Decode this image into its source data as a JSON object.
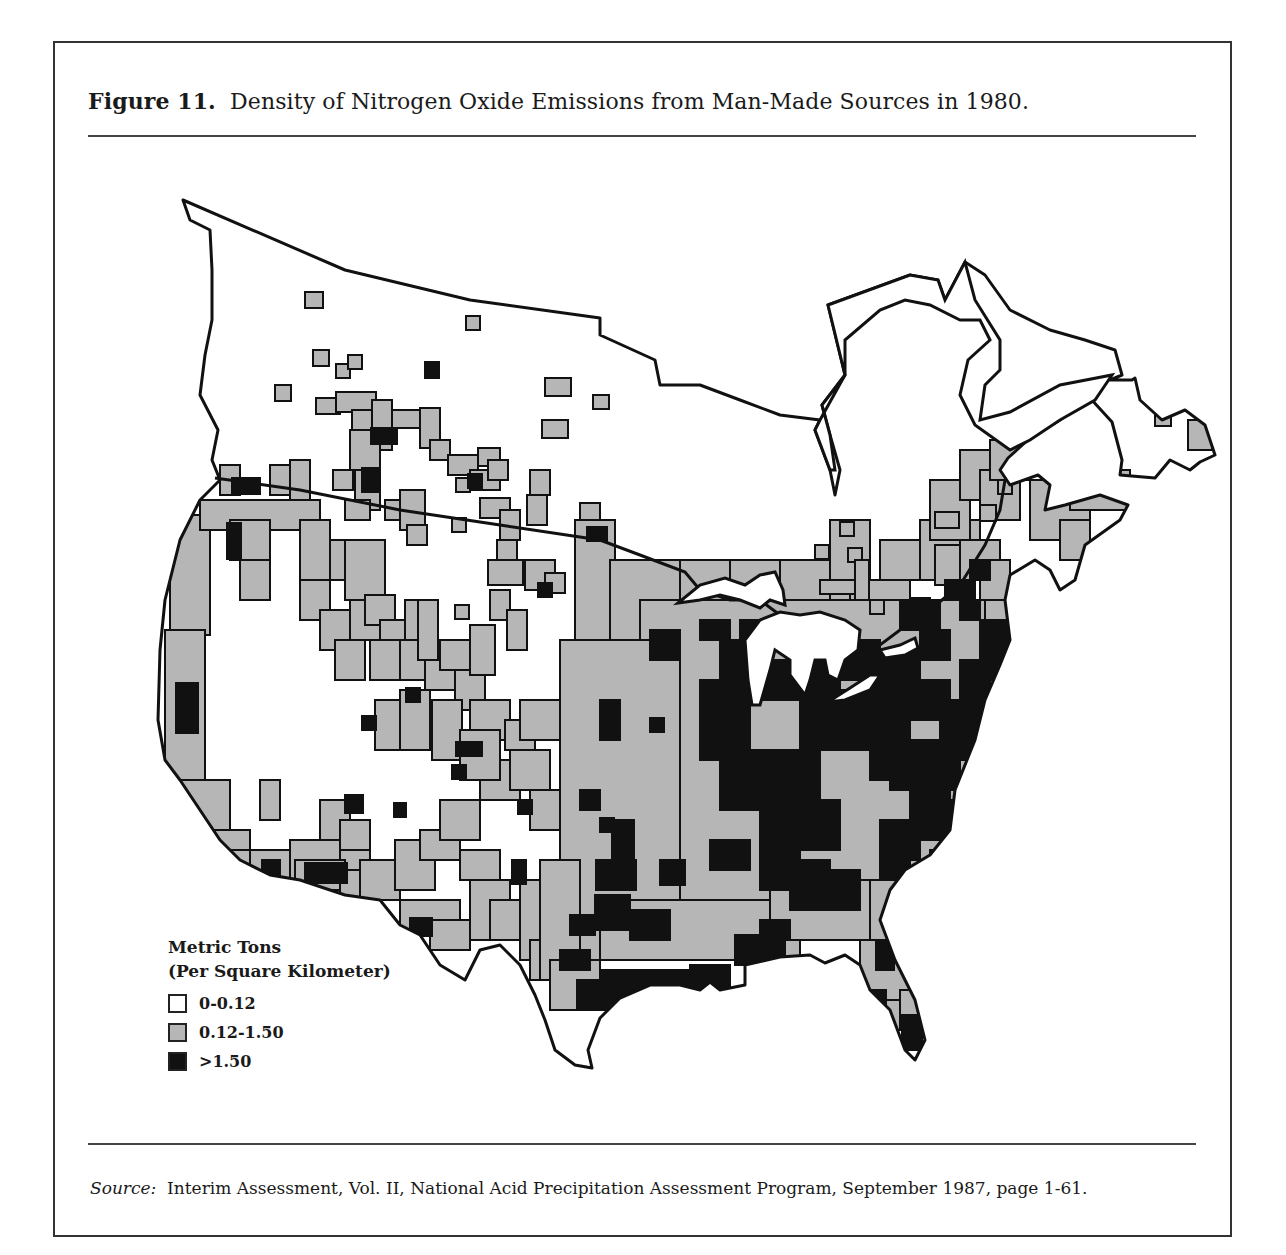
{
  "figure": {
    "label": "Figure 11.",
    "title": "Density of Nitrogen Oxide Emissions from Man-Made Sources in 1980."
  },
  "legend": {
    "title_line1": "Metric Tons",
    "title_line2": "(Per Square Kilometer)",
    "items": [
      {
        "label": "0-0.12",
        "color": "#ffffff"
      },
      {
        "label": "0.12-1.50",
        "color": "#b6b6b6"
      },
      {
        "label": ">1.50",
        "color": "#111111"
      }
    ]
  },
  "source": {
    "prefix": "Source:",
    "text": "Interim Assessment, Vol. II, National Acid Precipitation Assessment Program, September 1987, page 1-61."
  },
  "chart_data": {
    "type": "heatmap",
    "title": "Density of Nitrogen Oxide Emissions from Man-Made Sources in 1980",
    "subtitle": "Figure 11",
    "region": "Canada and contiguous United States",
    "units": "Metric Tons (Per Square Kilometer)",
    "categories": [
      "0-0.12",
      "0.12-1.50",
      ">1.50"
    ],
    "colors": {
      "low": "#ffffff",
      "mid": "#b6b6b6",
      "high": "#111111"
    },
    "legend_position": "lower-left",
    "summary": {
      "high_density_regions": [
        "Ohio Valley / Great Lakes",
        "Northeast corridor",
        "Gulf Coast (Texas, Louisiana)",
        "Southern California",
        "Pacific Northwest (Puget Sound)",
        "Florida"
      ],
      "mid_density_regions": [
        "Eastern half of US",
        "West coast",
        "Southern Canada belt"
      ],
      "low_density_regions": [
        "Northern Canada",
        "Great Basin / Intermountain West",
        "Northern Plains"
      ]
    },
    "cells": {
      "mid": [
        [
          305,
          292,
          18,
          16
        ],
        [
          466,
          316,
          14,
          14
        ],
        [
          313,
          350,
          16,
          16
        ],
        [
          336,
          364,
          14,
          14
        ],
        [
          348,
          355,
          14,
          14
        ],
        [
          275,
          385,
          16,
          16
        ],
        [
          545,
          378,
          26,
          18
        ],
        [
          593,
          395,
          16,
          14
        ],
        [
          542,
          420,
          26,
          18
        ],
        [
          316,
          398,
          24,
          16
        ],
        [
          336,
          392,
          40,
          20
        ],
        [
          352,
          410,
          40,
          40
        ],
        [
          372,
          400,
          20,
          30
        ],
        [
          392,
          410,
          40,
          18
        ],
        [
          420,
          408,
          20,
          40
        ],
        [
          430,
          440,
          20,
          20
        ],
        [
          448,
          455,
          30,
          20
        ],
        [
          478,
          448,
          22,
          18
        ],
        [
          470,
          470,
          30,
          20
        ],
        [
          488,
          460,
          20,
          20
        ],
        [
          456,
          478,
          14,
          14
        ],
        [
          350,
          430,
          30,
          40
        ],
        [
          355,
          470,
          25,
          40
        ],
        [
          270,
          465,
          30,
          30
        ],
        [
          290,
          460,
          20,
          45
        ],
        [
          220,
          465,
          20,
          30
        ],
        [
          298,
          500,
          20,
          20
        ],
        [
          333,
          470,
          20,
          20
        ],
        [
          345,
          500,
          25,
          20
        ],
        [
          385,
          500,
          20,
          20
        ],
        [
          400,
          490,
          25,
          40
        ],
        [
          407,
          525,
          20,
          20
        ],
        [
          452,
          518,
          14,
          14
        ],
        [
          480,
          498,
          30,
          20
        ],
        [
          500,
          510,
          20,
          30
        ],
        [
          527,
          495,
          20,
          30
        ],
        [
          530,
          470,
          20,
          25
        ],
        [
          580,
          503,
          20,
          20
        ],
        [
          497,
          540,
          20,
          30
        ],
        [
          488,
          560,
          35,
          25
        ],
        [
          525,
          560,
          30,
          30
        ],
        [
          545,
          573,
          20,
          20
        ],
        [
          575,
          565,
          20,
          30
        ],
        [
          170,
          515,
          40,
          120
        ],
        [
          165,
          630,
          40,
          150
        ],
        [
          170,
          780,
          60,
          60
        ],
        [
          200,
          830,
          50,
          30
        ],
        [
          210,
          850,
          50,
          30
        ],
        [
          250,
          850,
          40,
          40
        ],
        [
          290,
          840,
          50,
          40
        ],
        [
          340,
          850,
          30,
          30
        ],
        [
          200,
          500,
          120,
          30
        ],
        [
          230,
          520,
          40,
          40
        ],
        [
          240,
          560,
          30,
          40
        ],
        [
          300,
          520,
          30,
          60
        ],
        [
          330,
          540,
          30,
          40
        ],
        [
          345,
          540,
          40,
          60
        ],
        [
          350,
          600,
          30,
          40
        ],
        [
          365,
          595,
          30,
          30
        ],
        [
          380,
          620,
          30,
          30
        ],
        [
          300,
          580,
          30,
          40
        ],
        [
          320,
          610,
          30,
          40
        ],
        [
          335,
          640,
          30,
          40
        ],
        [
          370,
          640,
          30,
          40
        ],
        [
          400,
          640,
          40,
          40
        ],
        [
          425,
          650,
          30,
          40
        ],
        [
          440,
          640,
          40,
          30
        ],
        [
          455,
          670,
          30,
          40
        ],
        [
          470,
          700,
          40,
          40
        ],
        [
          480,
          760,
          40,
          40
        ],
        [
          405,
          600,
          20,
          40
        ],
        [
          418,
          600,
          20,
          60
        ],
        [
          455,
          605,
          14,
          14
        ],
        [
          470,
          625,
          25,
          50
        ],
        [
          490,
          590,
          20,
          30
        ],
        [
          507,
          610,
          20,
          40
        ],
        [
          375,
          700,
          40,
          50
        ],
        [
          400,
          690,
          30,
          60
        ],
        [
          432,
          700,
          30,
          60
        ],
        [
          460,
          730,
          40,
          50
        ],
        [
          505,
          720,
          30,
          30
        ],
        [
          520,
          700,
          40,
          40
        ],
        [
          510,
          750,
          40,
          40
        ],
        [
          530,
          790,
          30,
          40
        ],
        [
          320,
          800,
          30,
          40
        ],
        [
          340,
          820,
          30,
          30
        ],
        [
          260,
          780,
          20,
          40
        ],
        [
          295,
          860,
          50,
          30
        ],
        [
          340,
          870,
          30,
          30
        ],
        [
          360,
          860,
          40,
          40
        ],
        [
          395,
          840,
          40,
          50
        ],
        [
          420,
          830,
          40,
          30
        ],
        [
          440,
          800,
          40,
          40
        ],
        [
          460,
          850,
          40,
          30
        ],
        [
          400,
          900,
          60,
          30
        ],
        [
          430,
          920,
          40,
          30
        ],
        [
          470,
          880,
          40,
          60
        ],
        [
          490,
          900,
          40,
          40
        ],
        [
          520,
          880,
          40,
          80
        ],
        [
          530,
          940,
          40,
          40
        ],
        [
          560,
          950,
          40,
          40
        ],
        [
          575,
          520,
          40,
          440
        ],
        [
          610,
          560,
          100,
          400
        ],
        [
          680,
          560,
          60,
          60
        ],
        [
          700,
          590,
          40,
          40
        ],
        [
          730,
          560,
          80,
          40
        ],
        [
          780,
          560,
          60,
          40
        ],
        [
          830,
          520,
          40,
          80
        ],
        [
          850,
          580,
          60,
          40
        ],
        [
          880,
          540,
          60,
          40
        ],
        [
          920,
          520,
          60,
          60
        ],
        [
          930,
          480,
          40,
          60
        ],
        [
          960,
          450,
          40,
          50
        ],
        [
          980,
          470,
          40,
          50
        ],
        [
          990,
          440,
          40,
          40
        ],
        [
          1030,
          480,
          60,
          60
        ],
        [
          1070,
          470,
          60,
          40
        ],
        [
          1060,
          520,
          30,
          40
        ],
        [
          1155,
          410,
          16,
          16
        ],
        [
          1188,
          420,
          24,
          30
        ],
        [
          640,
          600,
          370,
          330
        ],
        [
          560,
          640,
          120,
          320
        ],
        [
          540,
          860,
          40,
          120
        ],
        [
          550,
          960,
          50,
          50
        ],
        [
          600,
          900,
          200,
          60
        ],
        [
          770,
          880,
          170,
          60
        ],
        [
          870,
          880,
          60,
          150
        ],
        [
          860,
          940,
          80,
          60
        ],
        [
          900,
          990,
          30,
          40
        ],
        [
          935,
          545,
          40,
          40
        ],
        [
          960,
          540,
          40,
          40
        ],
        [
          980,
          560,
          30,
          40
        ],
        [
          985,
          600,
          30,
          60
        ],
        [
          1000,
          620,
          25,
          40
        ],
        [
          815,
          545,
          14,
          14
        ],
        [
          840,
          522,
          14,
          14
        ],
        [
          848,
          548,
          14,
          14
        ],
        [
          820,
          580,
          40,
          14
        ],
        [
          855,
          560,
          14,
          40
        ],
        [
          870,
          600,
          14,
          14
        ],
        [
          935,
          512,
          24,
          16
        ],
        [
          980,
          505,
          16,
          16
        ],
        [
          998,
          480,
          14,
          14
        ]
      ],
      "high": [
        [
          425,
          362,
          14,
          16
        ],
        [
          371,
          428,
          26,
          16
        ],
        [
          362,
          468,
          16,
          24
        ],
        [
          232,
          478,
          28,
          16
        ],
        [
          468,
          474,
          14,
          14
        ],
        [
          587,
          527,
          20,
          14
        ],
        [
          227,
          523,
          14,
          36
        ],
        [
          538,
          583,
          14,
          14
        ],
        [
          406,
          688,
          14,
          14
        ],
        [
          362,
          716,
          14,
          14
        ],
        [
          456,
          742,
          26,
          14
        ],
        [
          452,
          765,
          14,
          14
        ],
        [
          176,
          683,
          22,
          50
        ],
        [
          170,
          820,
          30,
          40
        ],
        [
          305,
          863,
          42,
          20
        ],
        [
          262,
          860,
          18,
          18
        ],
        [
          345,
          795,
          18,
          18
        ],
        [
          394,
          803,
          12,
          14
        ],
        [
          518,
          800,
          14,
          14
        ],
        [
          512,
          860,
          14,
          24
        ],
        [
          410,
          918,
          22,
          18
        ],
        [
          600,
          700,
          20,
          40
        ],
        [
          650,
          718,
          14,
          14
        ],
        [
          650,
          630,
          30,
          30
        ],
        [
          600,
          818,
          14,
          14
        ],
        [
          580,
          790,
          20,
          20
        ],
        [
          612,
          820,
          22,
          60
        ],
        [
          596,
          860,
          40,
          30
        ],
        [
          570,
          915,
          25,
          20
        ],
        [
          595,
          895,
          35,
          35
        ],
        [
          630,
          910,
          40,
          30
        ],
        [
          560,
          950,
          30,
          20
        ],
        [
          577,
          980,
          25,
          30
        ],
        [
          600,
          970,
          90,
          40
        ],
        [
          690,
          965,
          40,
          30
        ],
        [
          735,
          935,
          50,
          30
        ],
        [
          760,
          920,
          30,
          20
        ],
        [
          660,
          860,
          25,
          25
        ],
        [
          700,
          620,
          30,
          20
        ],
        [
          720,
          640,
          40,
          40
        ],
        [
          740,
          620,
          30,
          30
        ],
        [
          760,
          660,
          80,
          40
        ],
        [
          700,
          680,
          50,
          80
        ],
        [
          720,
          750,
          100,
          60
        ],
        [
          760,
          800,
          80,
          50
        ],
        [
          800,
          690,
          70,
          60
        ],
        [
          820,
          640,
          60,
          40
        ],
        [
          860,
          650,
          60,
          60
        ],
        [
          870,
          700,
          40,
          80
        ],
        [
          900,
          740,
          60,
          50
        ],
        [
          910,
          780,
          40,
          60
        ],
        [
          880,
          820,
          40,
          40
        ],
        [
          710,
          840,
          40,
          30
        ],
        [
          760,
          850,
          40,
          40
        ],
        [
          790,
          860,
          40,
          50
        ],
        [
          830,
          870,
          30,
          40
        ],
        [
          880,
          850,
          30,
          30
        ],
        [
          900,
          870,
          40,
          30
        ],
        [
          930,
          850,
          30,
          20
        ],
        [
          950,
          800,
          40,
          40
        ],
        [
          940,
          700,
          40,
          60
        ],
        [
          960,
          660,
          30,
          60
        ],
        [
          980,
          620,
          30,
          60
        ],
        [
          960,
          600,
          20,
          20
        ],
        [
          900,
          600,
          40,
          30
        ],
        [
          920,
          630,
          30,
          30
        ],
        [
          910,
          680,
          40,
          40
        ],
        [
          890,
          760,
          50,
          30
        ],
        [
          940,
          760,
          20,
          30
        ],
        [
          868,
          990,
          18,
          30
        ],
        [
          876,
          940,
          18,
          30
        ],
        [
          902,
          1015,
          20,
          35
        ],
        [
          970,
          560,
          20,
          20
        ],
        [
          945,
          580,
          30,
          20
        ],
        [
          910,
          598,
          20,
          18
        ]
      ]
    }
  }
}
